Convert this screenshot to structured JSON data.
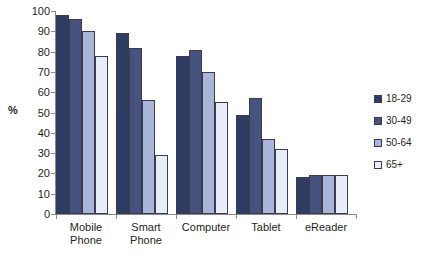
{
  "chart_data": {
    "type": "bar",
    "title": "",
    "subtitle": "",
    "xlabel": "",
    "ylabel": "%",
    "ylim": [
      0,
      100
    ],
    "ytick_step": 10,
    "yticks": [
      100,
      90,
      80,
      70,
      60,
      50,
      40,
      30,
      20,
      10,
      0
    ],
    "grid": false,
    "legend_position": "right",
    "categories": [
      "Mobile Phone",
      "Smart Phone",
      "Computer",
      "Tablet",
      "eReader"
    ],
    "category_lines": [
      [
        "Mobile",
        "Phone"
      ],
      [
        "Smart",
        "Phone"
      ],
      [
        "Computer"
      ],
      [
        "Tablet"
      ],
      [
        "eReader"
      ]
    ],
    "series": [
      {
        "name": "18-29",
        "color": "#2e3d64",
        "values": [
          98,
          89,
          78,
          49,
          18
        ]
      },
      {
        "name": "30-49",
        "color": "#47537f",
        "values": [
          96,
          82,
          81,
          57,
          19
        ]
      },
      {
        "name": "50-64",
        "color": "#a8b4d8",
        "values": [
          90,
          56,
          70,
          37,
          19
        ]
      },
      {
        "name": "65+",
        "color": "#e7ecf7",
        "values": [
          78,
          29,
          55,
          32,
          19
        ]
      }
    ]
  },
  "legend": {
    "items": [
      {
        "label": "18-29"
      },
      {
        "label": "30-49"
      },
      {
        "label": "50-64"
      },
      {
        "label": "65+"
      }
    ]
  }
}
